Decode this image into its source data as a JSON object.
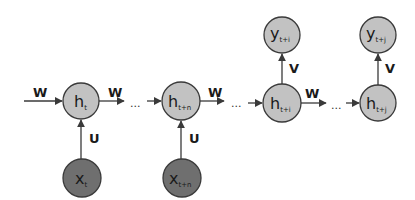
{
  "diagram": {
    "title": "",
    "colors": {
      "hidden_fill": "#c2c2c2",
      "output_fill": "#c2c2c2",
      "input_fill": "#6f6f6f",
      "stroke": "#3a3a3a",
      "arrow": "#3a3a3a"
    },
    "nodes": {
      "h_t": {
        "main": "h",
        "sub": "t",
        "cx": 81,
        "cy": 101,
        "r": 18,
        "kind": "hidden"
      },
      "x_t": {
        "main": "x",
        "sub": "t",
        "cx": 82,
        "cy": 178,
        "r": 19,
        "kind": "input"
      },
      "h_tn": {
        "main": "h",
        "sub": "t+n",
        "cx": 181,
        "cy": 101,
        "r": 19,
        "kind": "hidden"
      },
      "x_tn": {
        "main": "x",
        "sub": "t+n",
        "cx": 182,
        "cy": 178,
        "r": 19,
        "kind": "input"
      },
      "h_ti": {
        "main": "h",
        "sub": "t+i",
        "cx": 282,
        "cy": 103,
        "r": 19,
        "kind": "hidden"
      },
      "y_ti": {
        "main": "y",
        "sub": "t+i",
        "cx": 282,
        "cy": 35,
        "r": 18,
        "kind": "output"
      },
      "h_tj": {
        "main": "h",
        "sub": "t+j",
        "cx": 378,
        "cy": 103,
        "r": 18,
        "kind": "hidden"
      },
      "y_tj": {
        "main": "y",
        "sub": "t+j",
        "cx": 378,
        "cy": 35,
        "r": 18,
        "kind": "output"
      }
    },
    "edge_labels": {
      "w_in": "W",
      "w_1": "W",
      "w_2": "W",
      "w_3": "W",
      "u_1": "U",
      "u_2": "U",
      "v_1": "V",
      "v_2": "V"
    },
    "ellipsis": "..."
  }
}
